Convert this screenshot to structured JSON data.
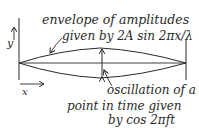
{
  "diagram": {
    "colors": {
      "ink": "#2a2a2a",
      "background": "#ffffff"
    },
    "labels": {
      "envelope_line1": "envelope of amplitudes",
      "envelope_line2": "given by 2A sin 2πx/λ",
      "oscillation_line1": "oscillation of a",
      "oscillation_line2": "point in time given",
      "oscillation_line3": "by cos 2πft",
      "y_axis": "y",
      "x_axis": "x"
    },
    "elements": [
      "left-boundary-line",
      "right-boundary-line",
      "horizontal-axis",
      "upper-envelope-curve",
      "lower-envelope-curve",
      "amplitude-double-arrow",
      "y-axis-arrow",
      "x-axis-arrow",
      "envelope-pointer-arrow",
      "oscillation-pointer-arrow"
    ]
  }
}
